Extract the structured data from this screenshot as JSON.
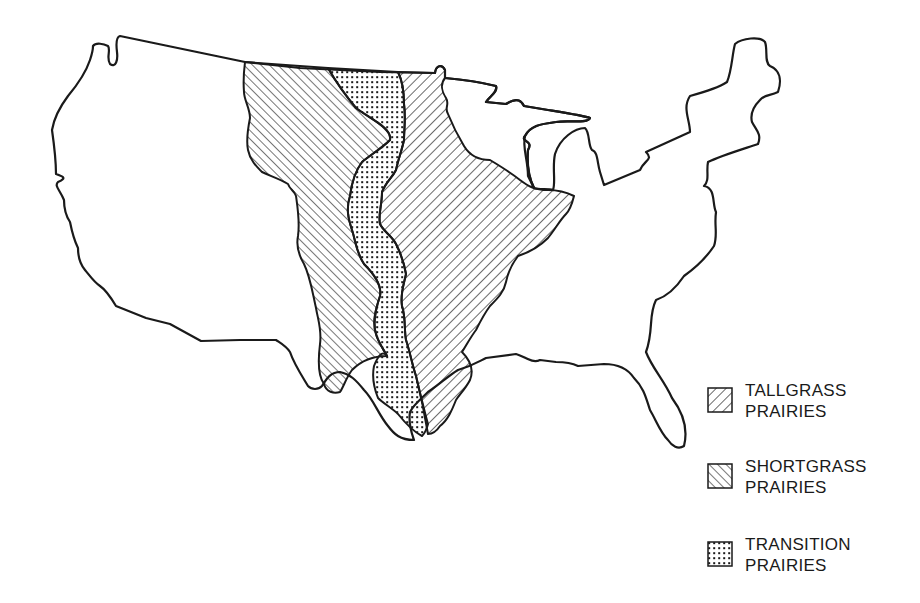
{
  "map": {
    "title": "",
    "subject": "Prairie regions of the United States",
    "outline_color": "#1a1a1a",
    "background": "#ffffff"
  },
  "legend": {
    "items": [
      {
        "id": "tallgrass",
        "line1": "TALLGRASS",
        "line2": "PRAIRIES",
        "pattern": "diagonal-hatch-forward"
      },
      {
        "id": "shortgrass",
        "line1": "SHORTGRASS",
        "line2": "PRAIRIES",
        "pattern": "diagonal-hatch-backward"
      },
      {
        "id": "transition",
        "line1": "TRANSITION",
        "line2": "PRAIRIES",
        "pattern": "dot-grid"
      }
    ]
  }
}
